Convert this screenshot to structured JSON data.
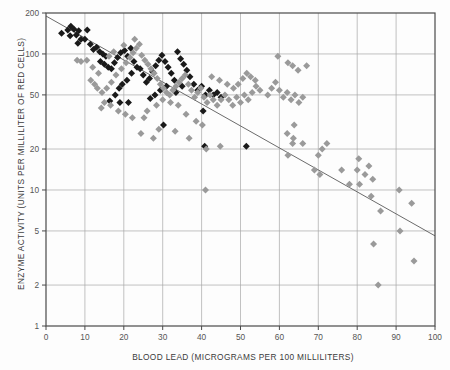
{
  "figure": {
    "background": "#fdfdfd",
    "axis_color": "#4a4a4a",
    "grid_color": "#a8a8a8",
    "tick_label_color": "#555555",
    "line_color": "#6b6b6b",
    "series_dark_color": "#1a1a1a",
    "series_light_color": "#9a9a9a"
  },
  "axes": {
    "x_title": "BLOOD LEAD (MICROGRAMS PER 100 MILLILITERS)",
    "y_title": "ENZYME ACTIVITY (UNITS PER MILLILITER OF RED CELLS)",
    "x_ticks": [
      "0",
      "10",
      "20",
      "30",
      "40",
      "50",
      "60",
      "70",
      "80",
      "90",
      "100"
    ],
    "y_ticks": [
      "1",
      "2",
      "5",
      "10",
      "20",
      "50",
      "100",
      "200"
    ]
  },
  "chart_data": {
    "type": "scatter",
    "title": "",
    "xlabel": "BLOOD LEAD (MICROGRAMS PER 100 MILLILITERS)",
    "ylabel": "ENZYME ACTIVITY (UNITS PER MILLILITER OF RED CELLS)",
    "xscale": "linear",
    "yscale": "log",
    "xlim": [
      0,
      100
    ],
    "ylim": [
      1,
      200
    ],
    "xticks": [
      0,
      10,
      20,
      30,
      40,
      50,
      60,
      70,
      80,
      90,
      100
    ],
    "yticks": [
      1,
      2,
      5,
      10,
      20,
      50,
      100,
      200
    ],
    "grid": true,
    "legend": "none",
    "series": [
      {
        "name": "dark-group",
        "marker": "diamond",
        "color": "#1a1a1a",
        "points": [
          [
            4.0,
            142
          ],
          [
            5.6,
            150
          ],
          [
            6.4,
            160
          ],
          [
            7.2,
            152
          ],
          [
            6.2,
            136
          ],
          [
            7.8,
            138
          ],
          [
            8.4,
            148
          ],
          [
            9.0,
            128
          ],
          [
            8.2,
            120
          ],
          [
            10.6,
            150
          ],
          [
            10.0,
            128
          ],
          [
            11.4,
            118
          ],
          [
            12.2,
            108
          ],
          [
            13.0,
            112
          ],
          [
            13.8,
            104
          ],
          [
            14.6,
            100
          ],
          [
            15.4,
            96
          ],
          [
            14.0,
            88
          ],
          [
            15.0,
            84
          ],
          [
            16.0,
            80
          ],
          [
            16.8,
            78
          ],
          [
            17.6,
            86
          ],
          [
            18.4,
            94
          ],
          [
            19.2,
            102
          ],
          [
            20.2,
            106
          ],
          [
            21.0,
            96
          ],
          [
            21.8,
            110
          ],
          [
            22.6,
            88
          ],
          [
            23.4,
            80
          ],
          [
            22.0,
            72
          ],
          [
            20.8,
            64
          ],
          [
            19.6,
            60
          ],
          [
            18.8,
            56
          ],
          [
            17.8,
            50
          ],
          [
            16.4,
            45
          ],
          [
            19.0,
            44
          ],
          [
            21.2,
            44
          ],
          [
            24.2,
            78
          ],
          [
            25.0,
            70
          ],
          [
            25.8,
            62
          ],
          [
            26.6,
            66
          ],
          [
            27.4,
            74
          ],
          [
            28.2,
            82
          ],
          [
            29.0,
            90
          ],
          [
            29.8,
            98
          ],
          [
            30.6,
            88
          ],
          [
            31.4,
            80
          ],
          [
            32.2,
            72
          ],
          [
            33.0,
            64
          ],
          [
            31.0,
            58
          ],
          [
            29.4,
            54
          ],
          [
            28.0,
            50
          ],
          [
            26.8,
            47
          ],
          [
            33.8,
            104
          ],
          [
            34.6,
            92
          ],
          [
            35.4,
            84
          ],
          [
            36.2,
            76
          ],
          [
            37.0,
            68
          ],
          [
            35.0,
            58
          ],
          [
            33.4,
            52
          ],
          [
            38.0,
            60
          ],
          [
            39.0,
            54
          ],
          [
            40.0,
            58
          ],
          [
            41.0,
            50
          ],
          [
            42.0,
            54
          ],
          [
            43.0,
            50
          ],
          [
            44.0,
            52
          ],
          [
            45.0,
            48
          ],
          [
            40.4,
            38
          ],
          [
            30.2,
            30
          ],
          [
            40.8,
            21
          ],
          [
            51.5,
            21
          ]
        ]
      },
      {
        "name": "light-group",
        "marker": "diamond",
        "color": "#9a9a9a",
        "points": [
          [
            8.0,
            90
          ],
          [
            9.0,
            88
          ],
          [
            10.5,
            90
          ],
          [
            12.0,
            80
          ],
          [
            13.5,
            72
          ],
          [
            11.5,
            64
          ],
          [
            12.5,
            60
          ],
          [
            13.2,
            56
          ],
          [
            14.4,
            52
          ],
          [
            15.6,
            56
          ],
          [
            16.8,
            62
          ],
          [
            18.0,
            70
          ],
          [
            19.4,
            78
          ],
          [
            20.6,
            86
          ],
          [
            21.6,
            94
          ],
          [
            22.4,
            102
          ],
          [
            23.2,
            110
          ],
          [
            24.0,
            118
          ],
          [
            22.8,
            128
          ],
          [
            20.0,
            116
          ],
          [
            17.4,
            104
          ],
          [
            16.2,
            96
          ],
          [
            15.0,
            44
          ],
          [
            14.2,
            40
          ],
          [
            16.6,
            42
          ],
          [
            18.6,
            38
          ],
          [
            20.4,
            36
          ],
          [
            22.2,
            34
          ],
          [
            24.6,
            98
          ],
          [
            25.4,
            90
          ],
          [
            26.2,
            84
          ],
          [
            27.0,
            78
          ],
          [
            27.8,
            72
          ],
          [
            28.6,
            66
          ],
          [
            29.4,
            60
          ],
          [
            30.2,
            56
          ],
          [
            31.0,
            52
          ],
          [
            31.8,
            50
          ],
          [
            32.6,
            54
          ],
          [
            33.4,
            58
          ],
          [
            34.2,
            62
          ],
          [
            35.0,
            66
          ],
          [
            35.8,
            70
          ],
          [
            36.6,
            60
          ],
          [
            37.4,
            54
          ],
          [
            38.2,
            48
          ],
          [
            39.0,
            52
          ],
          [
            39.8,
            56
          ],
          [
            40.6,
            48
          ],
          [
            41.4,
            44
          ],
          [
            42.2,
            50
          ],
          [
            43.0,
            46
          ],
          [
            44.0,
            42
          ],
          [
            45.0,
            46
          ],
          [
            46.0,
            50
          ],
          [
            47.0,
            46
          ],
          [
            48.0,
            42
          ],
          [
            49.0,
            48
          ],
          [
            50.0,
            44
          ],
          [
            51.0,
            50
          ],
          [
            52.0,
            46
          ],
          [
            53.0,
            52
          ],
          [
            54.0,
            58
          ],
          [
            55.0,
            54
          ],
          [
            53.8,
            64
          ],
          [
            52.6,
            68
          ],
          [
            51.6,
            72
          ],
          [
            50.6,
            66
          ],
          [
            49.4,
            60
          ],
          [
            48.2,
            56
          ],
          [
            46.6,
            60
          ],
          [
            44.6,
            64
          ],
          [
            42.6,
            68
          ],
          [
            40.2,
            30
          ],
          [
            38.6,
            32
          ],
          [
            36.0,
            36
          ],
          [
            34.0,
            42
          ],
          [
            32.0,
            44
          ],
          [
            30.0,
            46
          ],
          [
            28.4,
            42
          ],
          [
            26.0,
            38
          ],
          [
            25.2,
            34
          ],
          [
            29.0,
            28
          ],
          [
            33.2,
            27
          ],
          [
            36.8,
            24
          ],
          [
            41.2,
            20
          ],
          [
            44.8,
            21
          ],
          [
            41.0,
            10
          ],
          [
            27.6,
            24
          ],
          [
            24.4,
            26
          ],
          [
            57.0,
            50
          ],
          [
            58.0,
            56
          ],
          [
            59.0,
            62
          ],
          [
            60.0,
            54
          ],
          [
            61.0,
            48
          ],
          [
            62.0,
            52
          ],
          [
            63.0,
            46
          ],
          [
            64.0,
            50
          ],
          [
            65.0,
            44
          ],
          [
            66.0,
            48
          ],
          [
            59.6,
            96
          ],
          [
            62.2,
            86
          ],
          [
            63.4,
            82
          ],
          [
            64.8,
            76
          ],
          [
            67.0,
            82
          ],
          [
            62.0,
            26
          ],
          [
            63.8,
            30
          ],
          [
            66.0,
            22
          ],
          [
            63.4,
            22
          ],
          [
            62.2,
            18
          ],
          [
            63.6,
            24
          ],
          [
            70.0,
            18
          ],
          [
            71.0,
            20
          ],
          [
            70.4,
            13
          ],
          [
            72.2,
            22
          ],
          [
            69.0,
            14
          ],
          [
            76.0,
            14
          ],
          [
            78.0,
            11
          ],
          [
            80.0,
            14
          ],
          [
            80.4,
            17
          ],
          [
            80.6,
            11
          ],
          [
            82.0,
            13
          ],
          [
            83.0,
            15
          ],
          [
            83.6,
            9
          ],
          [
            84.2,
            4
          ],
          [
            86.0,
            7
          ],
          [
            85.4,
            2
          ],
          [
            90.8,
            10
          ],
          [
            94.0,
            8
          ],
          [
            91.0,
            5
          ],
          [
            94.6,
            3
          ],
          [
            84.0,
            12
          ]
        ]
      }
    ],
    "trendline": {
      "name": "regression-line",
      "color": "#6b6b6b",
      "x_start": 0.0,
      "y_start": 190,
      "x_end": 100.0,
      "y_end": 4.6
    }
  }
}
